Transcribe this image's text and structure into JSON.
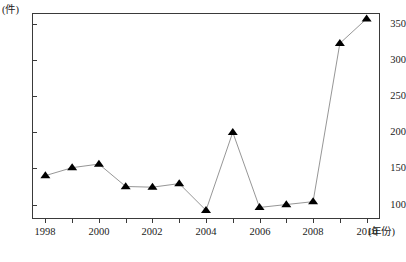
{
  "chart_data": {
    "type": "line",
    "title": "",
    "xlabel": "年份",
    "ylabel": "",
    "yunit": "(件)",
    "xunit": "(年份)",
    "grid": false,
    "legend": "none",
    "marker": "filled-triangle",
    "xlim": [
      1997.5,
      2010.5
    ],
    "ylim": [
      80,
      365
    ],
    "ytick_labels": [
      "350",
      "300",
      "250",
      "200",
      "150",
      "100"
    ],
    "ytick_values": [
      350,
      300,
      250,
      200,
      150,
      100
    ],
    "xtick_labels": [
      "1998",
      "2000",
      "2002",
      "2004",
      "2006",
      "2008",
      "2010"
    ],
    "xtick_values": [
      1998,
      2000,
      2002,
      2004,
      2006,
      2008,
      2010
    ],
    "x": [
      1998,
      1999,
      2000,
      2001,
      2002,
      2003,
      2004,
      2005,
      2006,
      2007,
      2008,
      2009,
      2010
    ],
    "values": [
      140,
      151,
      156,
      125,
      124,
      129,
      92,
      200,
      96,
      100,
      104,
      323,
      357
    ],
    "series": [
      {
        "name": "件数",
        "values": [
          140,
          151,
          156,
          125,
          124,
          129,
          92,
          200,
          96,
          100,
          104,
          323,
          357
        ]
      }
    ],
    "colors": {
      "marker": "#000000",
      "line": "#8a8a8a",
      "axis": "#3a3a3a",
      "text": "#222222"
    }
  },
  "caption": {
    "text": ""
  }
}
